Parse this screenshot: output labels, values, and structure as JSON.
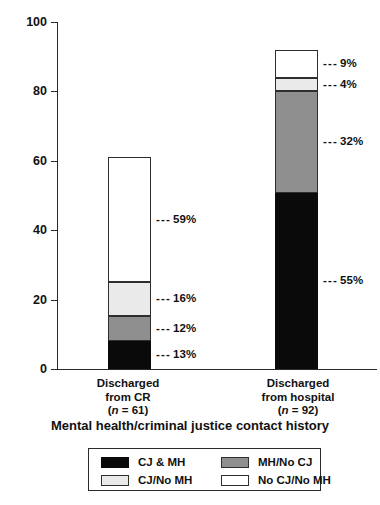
{
  "chart_data": {
    "type": "bar",
    "subtype": "stacked-bar",
    "title": "",
    "xlabel": "Mental health/criminal justice contact history",
    "ylabel": "",
    "ylim": [
      0,
      100
    ],
    "yticks": [
      0,
      20,
      40,
      60,
      80,
      100
    ],
    "ytick_labels": [
      "0",
      "20",
      "40",
      "60",
      "80",
      "100"
    ],
    "grid": false,
    "legend_position": "bottom",
    "categories": [
      "Discharged from CR (n = 61)",
      "Discharged from hospital (n = 92)"
    ],
    "series": [
      {
        "name": "CJ & MH",
        "color": "#0a0a0a",
        "values": [
          13,
          55
        ]
      },
      {
        "name": "MH/No CJ",
        "color": "#8f8f8f",
        "values": [
          12,
          32
        ]
      },
      {
        "name": "CJ/No MH",
        "color": "#eaeaea",
        "values": [
          16,
          4
        ]
      },
      {
        "name": "No CJ/No MH",
        "color": "#ffffff",
        "values": [
          59,
          9
        ]
      }
    ],
    "bar_totals": [
      61,
      92
    ],
    "data_labels": [
      [
        "13%",
        "12%",
        "16%",
        "59%"
      ],
      [
        "55%",
        "32%",
        "4%",
        "9%"
      ]
    ]
  },
  "axis": {
    "y_ticks": [
      {
        "label": "100",
        "value": 100
      },
      {
        "label": "80",
        "value": 80
      },
      {
        "label": "60",
        "value": 60
      },
      {
        "label": "40",
        "value": 40
      },
      {
        "label": "20",
        "value": 20
      },
      {
        "label": "0",
        "value": 0
      }
    ],
    "x_title": "Mental health/criminal justice contact history"
  },
  "bars": [
    {
      "id": "discharged-from-cr",
      "label_line1": "Discharged",
      "label_line2": "from CR",
      "label_line3_pre": "(",
      "label_line3_n": "n",
      "label_line3_post": " = 61)",
      "n": 61,
      "total": 61,
      "segments": [
        {
          "key": "cj-and-mh",
          "label": "CJ & MH",
          "percent": "13%",
          "value": 13,
          "fill": "black"
        },
        {
          "key": "mh-no-cj",
          "label": "MH/No CJ",
          "percent": "12%",
          "value": 12,
          "fill": "gray"
        },
        {
          "key": "cj-no-mh",
          "label": "CJ/No MH",
          "percent": "16%",
          "value": 16,
          "fill": "light"
        },
        {
          "key": "no-cj-no-mh",
          "label": "No CJ/No MH",
          "percent": "59%",
          "value": 59,
          "fill": "white"
        }
      ]
    },
    {
      "id": "discharged-from-hospital",
      "label_line1": "Discharged",
      "label_line2": "from hospital",
      "label_line3_pre": "(",
      "label_line3_n": "n",
      "label_line3_post": " = 92)",
      "n": 92,
      "total": 92,
      "segments": [
        {
          "key": "cj-and-mh",
          "label": "CJ & MH",
          "percent": "55%",
          "value": 55,
          "fill": "black"
        },
        {
          "key": "mh-no-cj",
          "label": "MH/No CJ",
          "percent": "32%",
          "value": 32,
          "fill": "gray"
        },
        {
          "key": "cj-no-mh",
          "label": "CJ/No MH",
          "percent": "4%",
          "value": 4,
          "fill": "light"
        },
        {
          "key": "no-cj-no-mh",
          "label": "No CJ/No MH",
          "percent": "9%",
          "value": 9,
          "fill": "white"
        }
      ]
    }
  ],
  "legend": {
    "items": [
      {
        "key": "cj-and-mh",
        "label": "CJ & MH",
        "fill": "black",
        "color": "#0a0a0a"
      },
      {
        "key": "mh-no-cj",
        "label": "MH/No CJ",
        "fill": "gray",
        "color": "#8f8f8f"
      },
      {
        "key": "cj-no-mh",
        "label": "CJ/No MH",
        "fill": "light",
        "color": "#eaeaea"
      },
      {
        "key": "no-cj-no-mh",
        "label": "No CJ/No MH",
        "fill": "white",
        "color": "#ffffff"
      }
    ]
  },
  "callout_dash": "---"
}
